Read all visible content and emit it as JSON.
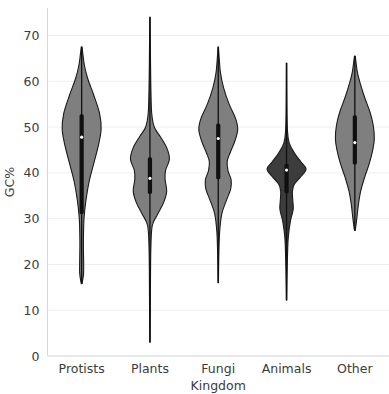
{
  "figure": {
    "width": 389,
    "height": 394,
    "background_color": "#ffffff",
    "title_partial": "",
    "title_visible": false
  },
  "axes": {
    "y_title": "GC%",
    "x_title": "Kingdom",
    "y_ticks": [
      "0",
      "10",
      "20",
      "30",
      "40",
      "50",
      "60",
      "70"
    ],
    "x_ticks": [
      "Protists",
      "Plants",
      "Fungi",
      "Animals",
      "Other"
    ],
    "grid_color": "#eceff1",
    "spine_color": "#d6dadd",
    "tick_text_color": "#3b3b3b"
  },
  "style": {
    "violin_fill": "#7f7f7f",
    "violin_fill_dark": "#3c3c3c",
    "violin_edge": "#1a1a1a",
    "box_color": "#101010",
    "median_color": "#ffffff"
  },
  "chart_data": {
    "type": "violin",
    "title": "",
    "xlabel": "Kingdom",
    "ylabel": "GC%",
    "ylim": [
      0,
      76
    ],
    "yticks": [
      0,
      10,
      20,
      30,
      40,
      50,
      60,
      70
    ],
    "grid": true,
    "legend": "none",
    "categories": [
      "Protists",
      "Plants",
      "Fungi",
      "Animals",
      "Other"
    ],
    "violins": [
      {
        "name": "Protists",
        "min": 15.8,
        "max": 67.5,
        "median": 47.8,
        "q1": 31.0,
        "q3": 52.8,
        "whisker_low": 15.8,
        "whisker_high": 67.5,
        "fill": "#7f7f7f",
        "density_profile": [
          {
            "y": 15.8,
            "w": 0.02
          },
          {
            "y": 18.0,
            "w": 0.1
          },
          {
            "y": 21.0,
            "w": 0.1
          },
          {
            "y": 25.0,
            "w": 0.09
          },
          {
            "y": 30.0,
            "w": 0.12
          },
          {
            "y": 34.0,
            "w": 0.22
          },
          {
            "y": 38.0,
            "w": 0.38
          },
          {
            "y": 42.0,
            "w": 0.62
          },
          {
            "y": 46.0,
            "w": 0.86
          },
          {
            "y": 49.5,
            "w": 1.0
          },
          {
            "y": 53.0,
            "w": 0.92
          },
          {
            "y": 57.0,
            "w": 0.62
          },
          {
            "y": 60.5,
            "w": 0.32
          },
          {
            "y": 63.5,
            "w": 0.14
          },
          {
            "y": 67.5,
            "w": 0.02
          }
        ]
      },
      {
        "name": "Plants",
        "min": 3.0,
        "max": 74.0,
        "median": 38.8,
        "q1": 35.4,
        "q3": 43.4,
        "whisker_low": 3.0,
        "whisker_high": 74.0,
        "fill": "#7f7f7f",
        "density_profile": [
          {
            "y": 3.0,
            "w": 0.01
          },
          {
            "y": 10.0,
            "w": 0.02
          },
          {
            "y": 18.0,
            "w": 0.03
          },
          {
            "y": 24.0,
            "w": 0.05
          },
          {
            "y": 28.5,
            "w": 0.12
          },
          {
            "y": 31.0,
            "w": 0.4
          },
          {
            "y": 33.5,
            "w": 0.7
          },
          {
            "y": 36.0,
            "w": 0.86
          },
          {
            "y": 38.5,
            "w": 0.78
          },
          {
            "y": 40.5,
            "w": 0.8
          },
          {
            "y": 43.0,
            "w": 1.0
          },
          {
            "y": 45.5,
            "w": 0.86
          },
          {
            "y": 48.0,
            "w": 0.52
          },
          {
            "y": 50.0,
            "w": 0.22
          },
          {
            "y": 53.0,
            "w": 0.09
          },
          {
            "y": 58.0,
            "w": 0.05
          },
          {
            "y": 64.0,
            "w": 0.03
          },
          {
            "y": 74.0,
            "w": 0.01
          }
        ]
      },
      {
        "name": "Fungi",
        "min": 16.0,
        "max": 67.5,
        "median": 47.5,
        "q1": 38.6,
        "q3": 50.8,
        "whisker_low": 16.0,
        "whisker_high": 67.5,
        "fill": "#7f7f7f",
        "density_profile": [
          {
            "y": 16.0,
            "w": 0.01
          },
          {
            "y": 22.0,
            "w": 0.03
          },
          {
            "y": 27.0,
            "w": 0.07
          },
          {
            "y": 31.0,
            "w": 0.18
          },
          {
            "y": 34.0,
            "w": 0.42
          },
          {
            "y": 36.5,
            "w": 0.64
          },
          {
            "y": 38.5,
            "w": 0.66
          },
          {
            "y": 40.5,
            "w": 0.5
          },
          {
            "y": 42.5,
            "w": 0.46
          },
          {
            "y": 44.5,
            "w": 0.62
          },
          {
            "y": 47.0,
            "w": 0.86
          },
          {
            "y": 49.5,
            "w": 1.0
          },
          {
            "y": 52.0,
            "w": 0.88
          },
          {
            "y": 55.0,
            "w": 0.56
          },
          {
            "y": 58.5,
            "w": 0.28
          },
          {
            "y": 62.0,
            "w": 0.11
          },
          {
            "y": 67.5,
            "w": 0.01
          }
        ]
      },
      {
        "name": "Animals",
        "min": 12.2,
        "max": 64.0,
        "median": 40.6,
        "q1": 35.5,
        "q3": 42.0,
        "whisker_low": 12.2,
        "whisker_high": 64.0,
        "fill": "#3c3c3c",
        "density_profile": [
          {
            "y": 12.2,
            "w": 0.01
          },
          {
            "y": 18.0,
            "w": 0.03
          },
          {
            "y": 22.0,
            "w": 0.05
          },
          {
            "y": 26.0,
            "w": 0.09
          },
          {
            "y": 29.5,
            "w": 0.2
          },
          {
            "y": 32.0,
            "w": 0.34
          },
          {
            "y": 34.0,
            "w": 0.32
          },
          {
            "y": 36.0,
            "w": 0.3
          },
          {
            "y": 37.5,
            "w": 0.4
          },
          {
            "y": 39.0,
            "w": 0.7
          },
          {
            "y": 40.8,
            "w": 1.0
          },
          {
            "y": 42.5,
            "w": 0.72
          },
          {
            "y": 44.5,
            "w": 0.38
          },
          {
            "y": 46.5,
            "w": 0.14
          },
          {
            "y": 49.0,
            "w": 0.05
          },
          {
            "y": 55.0,
            "w": 0.02
          },
          {
            "y": 64.0,
            "w": 0.01
          }
        ]
      },
      {
        "name": "Other",
        "min": 27.4,
        "max": 65.5,
        "median": 46.6,
        "q1": 41.8,
        "q3": 52.6,
        "whisker_low": 27.4,
        "whisker_high": 65.5,
        "fill": "#7f7f7f",
        "density_profile": [
          {
            "y": 27.4,
            "w": 0.02
          },
          {
            "y": 30.0,
            "w": 0.1
          },
          {
            "y": 33.0,
            "w": 0.18
          },
          {
            "y": 36.0,
            "w": 0.3
          },
          {
            "y": 39.0,
            "w": 0.5
          },
          {
            "y": 42.0,
            "w": 0.74
          },
          {
            "y": 45.0,
            "w": 0.92
          },
          {
            "y": 47.5,
            "w": 1.0
          },
          {
            "y": 50.5,
            "w": 0.94
          },
          {
            "y": 53.5,
            "w": 0.76
          },
          {
            "y": 56.5,
            "w": 0.5
          },
          {
            "y": 59.5,
            "w": 0.28
          },
          {
            "y": 62.0,
            "w": 0.13
          },
          {
            "y": 65.5,
            "w": 0.02
          }
        ]
      }
    ]
  }
}
